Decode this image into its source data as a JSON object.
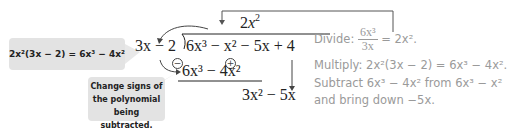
{
  "callouts": {
    "multiply_identity": "2x²(3x − 2) = 6x³ − 4x²",
    "change_signs": [
      "Change signs of",
      "the polynomial",
      "being subtracted."
    ]
  },
  "division": {
    "divisor": "3x − 2",
    "quotient_coef": "2",
    "quotient_var": "x",
    "quotient_exp": "2",
    "dividend": "6x³ − x² − 5x + 4",
    "subtracted": "6x³ − 4x²",
    "sign_changes": [
      "−",
      "+"
    ],
    "remainder": "3x² − 5x"
  },
  "steps": {
    "divide_label": "Divide:",
    "divide_num": "6x³",
    "divide_den": "3x",
    "divide_result": "= 2x².",
    "multiply": "Multiply:  2x²(3x − 2) = 6x³ − 4x².",
    "subtract": "Subtract 6x³ − 4x² from 6x³ − x²",
    "bring_down": "and bring down −5x."
  },
  "colors": {
    "callout_bg": "#e3e3e3",
    "note_text": "#9a9a9a",
    "math_text": "#222222"
  }
}
